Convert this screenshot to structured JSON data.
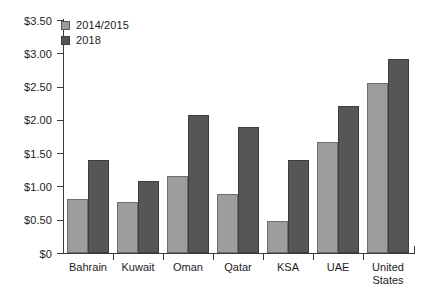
{
  "chart_data": {
    "type": "bar",
    "title": "",
    "subtitle": "",
    "xlabel": "",
    "ylabel": "",
    "categories": [
      "Bahrain",
      "Kuwait",
      "Oman",
      "Qatar",
      "KSA",
      "UAE",
      "United States"
    ],
    "series": [
      {
        "name": "2014/2015",
        "color": "#9d9d9d",
        "values": [
          0.81,
          0.77,
          1.15,
          0.89,
          0.48,
          1.67,
          2.55
        ]
      },
      {
        "name": "2018",
        "color": "#565656",
        "values": [
          1.4,
          1.08,
          2.07,
          1.9,
          1.4,
          2.21,
          2.91
        ]
      }
    ],
    "ylim": [
      0,
      3.5
    ],
    "ytick_values": [
      0,
      0.5,
      1.0,
      1.5,
      2.0,
      2.5,
      3.0,
      3.5
    ],
    "ytick_labels": [
      "$0",
      "$0.50",
      "$1.00",
      "$1.50",
      "$2.00",
      "$2.50",
      "$3.00",
      "$3.50"
    ],
    "grid": false,
    "legend_position": "top-left",
    "value_prefix": "$"
  }
}
